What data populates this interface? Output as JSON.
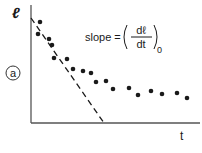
{
  "panel_label": "a",
  "y_axis_label": "ℓ",
  "x_axis_label": "t",
  "annotation": {
    "prefix": "slope =",
    "numerator": "dℓ",
    "denominator": "dt",
    "subscript": "0"
  },
  "chart_data": {
    "type": "scatter",
    "title": "",
    "xlabel": "t",
    "ylabel": "ℓ",
    "panel": "a",
    "grid": false,
    "legend": null,
    "annotation": "slope = (dℓ/dt)_0",
    "series": [
      {
        "name": "data points",
        "style": "filled-circle",
        "points": [
          [
            40,
            22
          ],
          [
            38,
            34
          ],
          [
            49,
            39
          ],
          [
            52,
            45
          ],
          [
            54,
            58
          ],
          [
            67,
            59
          ],
          [
            73,
            69
          ],
          [
            83,
            71
          ],
          [
            91,
            73
          ],
          [
            96,
            82
          ],
          [
            106,
            81
          ],
          [
            113,
            89
          ],
          [
            129,
            88
          ],
          [
            138,
            95
          ],
          [
            151,
            91
          ],
          [
            162,
            94
          ],
          [
            177,
            93
          ],
          [
            187,
            98
          ]
        ]
      },
      {
        "name": "initial slope tangent",
        "style": "dashed-line",
        "points": [
          [
            31,
            18
          ],
          [
            104,
            123
          ]
        ]
      }
    ],
    "axes": {
      "origin": [
        31,
        123
      ],
      "y_top": 5,
      "x_right": 200
    },
    "note": "Point coordinates are in screen pixels; axes have no numeric ticks."
  }
}
